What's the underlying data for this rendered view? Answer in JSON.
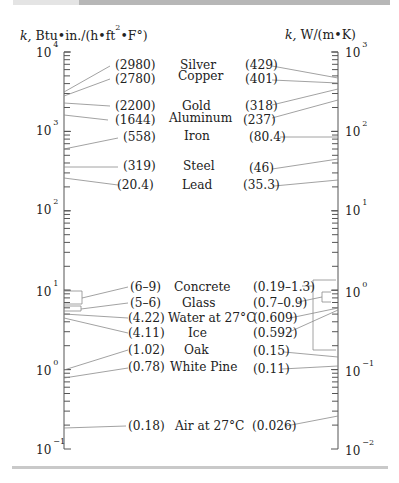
{
  "left_axis": {
    "title_k": "k,",
    "title_unit_pre": " Btu•in./(h•ft",
    "title_sup": "2",
    "title_unit_post": "•F°)",
    "decades": [
      {
        "base": "10",
        "exp": "4"
      },
      {
        "base": "10",
        "exp": "3"
      },
      {
        "base": "10",
        "exp": "2"
      },
      {
        "base": "10",
        "exp": "1"
      },
      {
        "base": "10",
        "exp": "0"
      },
      {
        "base": "10",
        "exp": "−1"
      }
    ]
  },
  "right_axis": {
    "title_k": "k,",
    "title_unit": " W/(m•K)",
    "decades": [
      {
        "base": "10",
        "exp": "3"
      },
      {
        "base": "10",
        "exp": "2"
      },
      {
        "base": "10",
        "exp": "1"
      },
      {
        "base": "10",
        "exp": "0"
      },
      {
        "base": "10",
        "exp": "−1"
      },
      {
        "base": "10",
        "exp": "−2"
      }
    ]
  },
  "materials": [
    {
      "name": "Silver",
      "left_value": "(2980)",
      "right_value": "(429)"
    },
    {
      "name": "Copper",
      "left_value": "(2780)",
      "right_value": "(401)"
    },
    {
      "name": "Gold",
      "left_value": "(2200)",
      "right_value": "(318)"
    },
    {
      "name": "Aluminum",
      "left_value": "(1644)",
      "right_value": "(237)"
    },
    {
      "name": "Iron",
      "left_value": "(558)",
      "right_value": "(80.4)"
    },
    {
      "name": "Steel",
      "left_value": "(319)",
      "right_value": "(46)"
    },
    {
      "name": "Lead",
      "left_value": "(20.4)",
      "right_value": "(35.3)"
    },
    {
      "name": "Concrete",
      "left_value": "(6–9)",
      "right_value": "(0.19–1.3)"
    },
    {
      "name": "Glass",
      "left_value": "(5–6)",
      "right_value": "(0.7–0.9)"
    },
    {
      "name": "Water at 27°C",
      "left_value": "(4.22)",
      "right_value": "(0.609)"
    },
    {
      "name": "Ice",
      "left_value": "(4.11)",
      "right_value": "(0.592)"
    },
    {
      "name": "Oak",
      "left_value": "(1.02)",
      "right_value": "(0.15)"
    },
    {
      "name": "White Pine",
      "left_value": "(0.78)",
      "right_value": "(0.11)"
    },
    {
      "name": "Air at 27°C",
      "left_value": "(0.18)",
      "right_value": "(0.026)"
    }
  ]
}
